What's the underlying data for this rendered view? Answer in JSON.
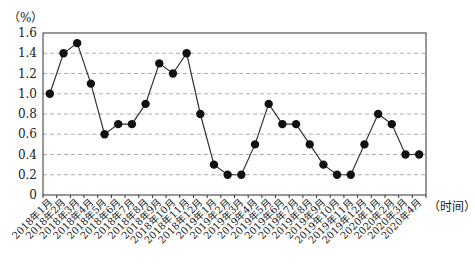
{
  "chart_data": {
    "type": "line",
    "title": "",
    "xlabel": "（时间）",
    "ylabel": "（%）",
    "ylim": [
      0,
      1.6
    ],
    "yticks": [
      "0",
      "0.2",
      "0.4",
      "0.6",
      "0.8",
      "1.0",
      "1.2",
      "1.4",
      "1.6"
    ],
    "grid": "horizontal dashed",
    "legend": "none",
    "categories": [
      "2018年1月",
      "2018年2月",
      "2018年3月",
      "2018年4月",
      "2018年5月",
      "2018年6月",
      "2018年7月",
      "2018年8月",
      "2018年9月",
      "2018年10月",
      "2018年11月",
      "2018年12月",
      "2019年1月",
      "2019年2月",
      "2019年3月",
      "2019年4月",
      "2019年5月",
      "2019年6月",
      "2019年7月",
      "2019年8月",
      "2019年9月",
      "2019年10月",
      "2019年11月",
      "2019年12月",
      "2020年1月",
      "2020年2月",
      "2020年3月",
      "2020年4月"
    ],
    "values": [
      1.0,
      1.4,
      1.5,
      1.1,
      0.6,
      0.7,
      0.7,
      0.9,
      1.3,
      1.2,
      1.4,
      0.8,
      0.3,
      0.2,
      0.2,
      0.5,
      0.9,
      0.7,
      0.7,
      0.5,
      0.3,
      0.2,
      0.2,
      0.5,
      0.8,
      0.7,
      0.4,
      0.4
    ]
  }
}
